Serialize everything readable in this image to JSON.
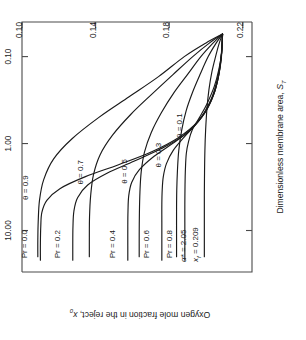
{
  "figure": {
    "rotation_deg": -90,
    "background": "#ffffff",
    "ink_color": "#1a1a1a"
  },
  "chart_data": {
    "type": "line",
    "title": "",
    "subtitle": "",
    "xlabel": "Dimensionless membrane area, S_T",
    "xlabel_main": "Dimensionless membrane area, ",
    "xlabel_sym": "S",
    "xlabel_sub": "T",
    "ylabel": "Oxygen mole fraction in the reject, x_0",
    "ylabel_main": "Oxygen mole fraction in the reject, ",
    "ylabel_sym": "x",
    "ylabel_sub": "0",
    "xscale": "log",
    "yscale": "linear",
    "xlim": [
      0.04,
      30.0
    ],
    "ylim": [
      0.1,
      0.225
    ],
    "xticks": [
      0.1,
      1.0,
      10.0
    ],
    "xticklabels": [
      "0.10",
      "1.00",
      "10.00"
    ],
    "yticks": [
      0.22,
      0.18,
      0.14,
      0.1
    ],
    "yticklabels": [
      "0.22",
      "0.18",
      "0.14",
      "0.10"
    ],
    "grid": false,
    "legend": "inline-curve-labels",
    "annotations": [
      {
        "name": "alpha-star",
        "symbol": "α*",
        "eq": "=",
        "value": "2.05",
        "text": "α* = 2.05"
      },
      {
        "name": "feed-mole-fraction",
        "symbol": "x",
        "sub": "f",
        "eq": "=",
        "value": "0.209",
        "text": "x_f = 0.209"
      }
    ],
    "families": [
      {
        "name": "pressure-ratio",
        "param": "Pr",
        "label_template": "Pr = {v}",
        "series": [
          {
            "name": "Pr = 0.8",
            "value": 0.8,
            "label": "Pr = 0.8",
            "points": [
              [
                0.055,
                0.209
              ],
              [
                0.09,
                0.2085
              ],
              [
                0.14,
                0.207
              ],
              [
                0.22,
                0.2045
              ],
              [
                0.35,
                0.2005
              ],
              [
                0.5,
                0.1965
              ],
              [
                0.7,
                0.1925
              ],
              [
                0.95,
                0.1905
              ],
              [
                1.3,
                0.1893
              ],
              [
                2.0,
                0.1888
              ],
              [
                3.0,
                0.1886
              ],
              [
                5.0,
                0.1885
              ],
              [
                8.0,
                0.1885
              ],
              [
                14.0,
                0.1885
              ],
              [
                22.0,
                0.1885
              ]
            ]
          },
          {
            "name": "Pr = 0.6",
            "value": 0.6,
            "label": "Pr = 0.6",
            "points": [
              [
                0.055,
                0.209
              ],
              [
                0.09,
                0.2085
              ],
              [
                0.15,
                0.2072
              ],
              [
                0.25,
                0.2048
              ],
              [
                0.4,
                0.2005
              ],
              [
                0.6,
                0.1945
              ],
              [
                0.85,
                0.188
              ],
              [
                1.2,
                0.1822
              ],
              [
                1.7,
                0.1785
              ],
              [
                2.4,
                0.1768
              ],
              [
                3.4,
                0.1762
              ],
              [
                5.0,
                0.176
              ],
              [
                8.0,
                0.176
              ],
              [
                14.0,
                0.176
              ],
              [
                22.0,
                0.176
              ]
            ]
          },
          {
            "name": "Pr = 0.4",
            "value": 0.4,
            "label": "Pr = 0.4",
            "points": [
              [
                0.055,
                0.209
              ],
              [
                0.1,
                0.2084
              ],
              [
                0.17,
                0.2068
              ],
              [
                0.28,
                0.204
              ],
              [
                0.45,
                0.1992
              ],
              [
                0.7,
                0.1915
              ],
              [
                1.0,
                0.1818
              ],
              [
                1.4,
                0.1718
              ],
              [
                2.0,
                0.1638
              ],
              [
                2.8,
                0.1596
              ],
              [
                4.0,
                0.158
              ],
              [
                6.0,
                0.1576
              ],
              [
                9.0,
                0.1575
              ],
              [
                15.0,
                0.1575
              ],
              [
                22.0,
                0.1575
              ]
            ]
          },
          {
            "name": "Pr = 0.2",
            "value": 0.2,
            "label": "Pr = 0.2",
            "points": [
              [
                0.055,
                0.209
              ],
              [
                0.1,
                0.2083
              ],
              [
                0.18,
                0.2065
              ],
              [
                0.3,
                0.2033
              ],
              [
                0.5,
                0.1976
              ],
              [
                0.8,
                0.188
              ],
              [
                1.15,
                0.1755
              ],
              [
                1.6,
                0.1608
              ],
              [
                2.2,
                0.1462
              ],
              [
                3.0,
                0.1357
              ],
              [
                4.2,
                0.1302
              ],
              [
                6.0,
                0.1282
              ],
              [
                9.0,
                0.1277
              ],
              [
                14.0,
                0.1276
              ],
              [
                22.0,
                0.1276
              ]
            ]
          },
          {
            "name": "Pr = 0.0",
            "value": 0.0,
            "label": "Pr = 0.0",
            "points": [
              [
                0.055,
                0.209
              ],
              [
                0.1,
                0.2082
              ],
              [
                0.18,
                0.2062
              ],
              [
                0.32,
                0.2025
              ],
              [
                0.55,
                0.1958
              ],
              [
                0.85,
                0.1852
              ],
              [
                1.25,
                0.1702
              ],
              [
                1.75,
                0.1525
              ],
              [
                2.4,
                0.1345
              ],
              [
                3.3,
                0.1206
              ],
              [
                4.5,
                0.1135
              ],
              [
                6.2,
                0.1108
              ],
              [
                9.0,
                0.1102
              ],
              [
                14.0,
                0.11
              ],
              [
                22.0,
                0.11
              ]
            ]
          }
        ]
      },
      {
        "name": "stage-cut",
        "param": "θ",
        "label_template": "θ = {v}",
        "series": [
          {
            "name": "θ = 0.1",
            "value": 0.1,
            "label": "θ = 0.1",
            "points": [
              [
                0.055,
                0.209
              ],
              [
                0.07,
                0.2072
              ],
              [
                0.1,
                0.2052
              ],
              [
                0.15,
                0.2032
              ],
              [
                0.24,
                0.2016
              ],
              [
                0.4,
                0.2005
              ],
              [
                0.7,
                0.1998
              ],
              [
                1.2,
                0.1994
              ],
              [
                2.2,
                0.1992
              ],
              [
                4.0,
                0.1991
              ],
              [
                7.0,
                0.1991
              ],
              [
                12.0,
                0.1991
              ],
              [
                20.0,
                0.1991
              ]
            ]
          },
          {
            "name": "θ = 0.3",
            "value": 0.3,
            "label": "θ = 0.3",
            "points": [
              [
                0.055,
                0.209
              ],
              [
                0.07,
                0.2055
              ],
              [
                0.1,
                0.2012
              ],
              [
                0.16,
                0.1968
              ],
              [
                0.26,
                0.1926
              ],
              [
                0.42,
                0.1892
              ],
              [
                0.7,
                0.1868
              ],
              [
                1.2,
                0.1852
              ],
              [
                2.0,
                0.1845
              ],
              [
                3.5,
                0.1841
              ],
              [
                6.0,
                0.184
              ],
              [
                11.0,
                0.184
              ],
              [
                20.0,
                0.184
              ]
            ]
          },
          {
            "name": "θ = 0.5",
            "value": 0.5,
            "label": "θ = 0.5",
            "points": [
              [
                0.055,
                0.209
              ],
              [
                0.07,
                0.2038
              ],
              [
                0.1,
                0.1972
              ],
              [
                0.16,
                0.19
              ],
              [
                0.26,
                0.1826
              ],
              [
                0.44,
                0.1758
              ],
              [
                0.75,
                0.1702
              ],
              [
                1.25,
                0.1666
              ],
              [
                2.1,
                0.1648
              ],
              [
                3.6,
                0.1641
              ],
              [
                6.5,
                0.1638
              ],
              [
                11.0,
                0.1637
              ],
              [
                20.0,
                0.1637
              ]
            ]
          },
          {
            "name": "θ = 0.7",
            "value": 0.7,
            "label": "θ = 0.7",
            "points": [
              [
                0.055,
                0.209
              ],
              [
                0.07,
                0.2018
              ],
              [
                0.1,
                0.1928
              ],
              [
                0.16,
                0.1822
              ],
              [
                0.27,
                0.1706
              ],
              [
                0.46,
                0.1592
              ],
              [
                0.8,
                0.1492
              ],
              [
                1.35,
                0.1424
              ],
              [
                2.3,
                0.1388
              ],
              [
                4.0,
                0.1373
              ],
              [
                7.0,
                0.1367
              ],
              [
                12.0,
                0.1366
              ],
              [
                20.0,
                0.1366
              ]
            ]
          },
          {
            "name": "θ = 0.9",
            "value": 0.9,
            "label": "θ = 0.9",
            "points": [
              [
                0.055,
                0.209
              ],
              [
                0.07,
                0.1998
              ],
              [
                0.1,
                0.1882
              ],
              [
                0.17,
                0.1742
              ],
              [
                0.29,
                0.1582
              ],
              [
                0.5,
                0.1418
              ],
              [
                0.88,
                0.1272
              ],
              [
                1.5,
                0.1172
              ],
              [
                2.6,
                0.1118
              ],
              [
                4.5,
                0.1095
              ],
              [
                8.0,
                0.1088
              ],
              [
                13.0,
                0.1086
              ],
              [
                20.0,
                0.1086
              ]
            ]
          }
        ]
      }
    ],
    "curve_labels": [
      {
        "name": "label-pr-0-8",
        "text": "Pr = 0.8"
      },
      {
        "name": "label-pr-0-6",
        "text": "Pr = 0.6"
      },
      {
        "name": "label-pr-0-4",
        "text": "Pr = 0.4"
      },
      {
        "name": "label-pr-0-2",
        "text": "Pr = 0.2"
      },
      {
        "name": "label-pr-0-0",
        "text": "Pr = 0.0"
      },
      {
        "name": "label-theta-0-1",
        "text": "θ = 0.1"
      },
      {
        "name": "label-theta-0-3",
        "text": "θ = 0.3"
      },
      {
        "name": "label-theta-0-5",
        "text": "θ = 0.5"
      },
      {
        "name": "label-theta-0-7",
        "text": "θ = 0.7"
      },
      {
        "name": "label-theta-0-9",
        "text": "θ = 0.9"
      }
    ]
  }
}
